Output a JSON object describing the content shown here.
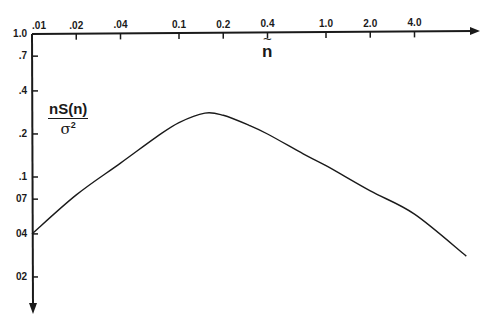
{
  "chart_data": {
    "type": "line",
    "title": "",
    "xlabel": "ñ",
    "ylabel": "nS(n)/σ²",
    "x_scale": "log",
    "y_scale": "log",
    "y_axis_direction": "downward",
    "x_ticks": [
      ".01",
      ".02",
      ".04",
      "0.1",
      "0.2",
      "0.4",
      "1.0",
      "2.0",
      "4.0"
    ],
    "y_ticks": [
      "1.0",
      ".7",
      ".4",
      ".2",
      ".1",
      "07",
      "04",
      "02"
    ],
    "xlim": [
      0.01,
      10
    ],
    "ylim": [
      0.015,
      1.0
    ],
    "grid": false,
    "legend": null,
    "series": [
      {
        "name": "nS(n)/σ²",
        "x": [
          0.01,
          0.02,
          0.04,
          0.07,
          0.1,
          0.15,
          0.2,
          0.3,
          0.4,
          0.7,
          1.0,
          2.0,
          4.0,
          9.0
        ],
        "y": [
          0.04,
          0.075,
          0.125,
          0.19,
          0.24,
          0.28,
          0.27,
          0.23,
          0.2,
          0.145,
          0.12,
          0.08,
          0.055,
          0.028
        ]
      }
    ]
  },
  "labels": {
    "x_axis_symbol": "n",
    "x_axis_tilde": "~",
    "y_numerator": "nS(n)",
    "y_denominator_symbol": "σ",
    "y_denominator_exp": "2"
  }
}
